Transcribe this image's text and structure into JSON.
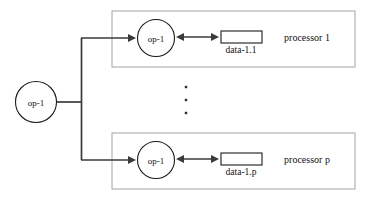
{
  "diagram": {
    "canvas": {
      "width": 376,
      "height": 203,
      "background": "#ffffff"
    },
    "colors": {
      "node_stroke": "#1a1a1a",
      "edge": "#3a3a3a",
      "group_box_stroke": "#9a9a9a",
      "text": "#111111",
      "fill": "#ffffff"
    },
    "source_node": {
      "label": "op-1",
      "shape": "circle",
      "cx": 36,
      "cy": 102,
      "r": 20.5
    },
    "fanout": {
      "junction_x": 81,
      "top_y": 38,
      "bottom_y": 160,
      "stem_from_x": 57,
      "stem_y": 102
    },
    "ellipsis": {
      "symbol": "vertical-dots",
      "count": 3,
      "x": 186,
      "ys": [
        87,
        100,
        113
      ]
    },
    "processors": [
      {
        "group_label": "processor 1",
        "box": {
          "x": 112,
          "y": 11,
          "width": 243,
          "height": 56
        },
        "node": {
          "label": "op-1",
          "cx": 156,
          "cy": 38,
          "r": 18.5
        },
        "data": {
          "label": "data-1.1",
          "box": {
            "x": 221,
            "y": 31,
            "width": 41,
            "height": 12
          },
          "label_x": 241,
          "label_y": 52
        },
        "incoming_arrow": {
          "from_x": 81,
          "to_x": 136,
          "y": 38
        },
        "link_arrow": {
          "from_x": 176,
          "to_x": 219,
          "y": 37,
          "double_headed": true
        },
        "group_label_x": 307,
        "group_label_y": 41
      },
      {
        "group_label": "processor p",
        "box": {
          "x": 112,
          "y": 133,
          "width": 243,
          "height": 56
        },
        "node": {
          "label": "op-1",
          "cx": 156,
          "cy": 160,
          "r": 18.5
        },
        "data": {
          "label": "data-1.p",
          "box": {
            "x": 221,
            "y": 153,
            "width": 41,
            "height": 12
          },
          "label_x": 241,
          "label_y": 174
        },
        "incoming_arrow": {
          "from_x": 81,
          "to_x": 136,
          "y": 160
        },
        "link_arrow": {
          "from_x": 176,
          "to_x": 219,
          "y": 159,
          "double_headed": true
        },
        "group_label_x": 307,
        "group_label_y": 163
      }
    ]
  }
}
